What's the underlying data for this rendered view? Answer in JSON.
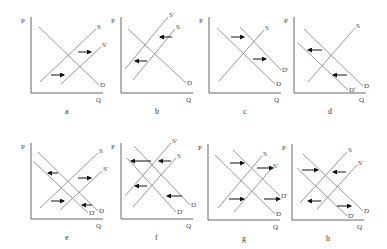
{
  "figure": {
    "axis_labels": {
      "price": "P",
      "quantity": "Q"
    },
    "panels": [
      {
        "id": "a",
        "caption": "a",
        "origin": [
          31,
          93
        ],
        "size": [
          72,
          76
        ],
        "curves": [
          {
            "name": "D",
            "label": "D",
            "from": [
              39,
              27
            ],
            "to": [
              99,
              85
            ]
          },
          {
            "name": "S",
            "label": "S",
            "from": [
              40,
              82
            ],
            "to": [
              96,
              29
            ]
          },
          {
            "name": "S'",
            "label": "S'",
            "from": [
              61,
              84
            ],
            "to": [
              101,
              47
            ]
          }
        ],
        "arrows": [
          {
            "from": [
              51,
              75
            ],
            "to": [
              64,
              75
            ],
            "direction": "right"
          },
          {
            "from": [
              78,
              52
            ],
            "to": [
              91,
              52
            ],
            "direction": "right"
          }
        ]
      },
      {
        "id": "b",
        "caption": "b",
        "origin": [
          121,
          93
        ],
        "size": [
          72,
          76
        ],
        "curves": [
          {
            "name": "D",
            "label": "D",
            "from": [
              128,
              29
            ],
            "to": [
              186,
              83
            ]
          },
          {
            "name": "S'",
            "label": "S'",
            "from": [
              125,
              69
            ],
            "to": [
              168,
              17
            ]
          },
          {
            "name": "S",
            "label": "S",
            "from": [
              133,
              80
            ],
            "to": [
              175,
              29
            ]
          }
        ],
        "arrows": [
          {
            "from": [
              172,
              37
            ],
            "to": [
              160,
              37
            ],
            "direction": "left"
          },
          {
            "from": [
              147,
              61
            ],
            "to": [
              135,
              61
            ],
            "direction": "left"
          }
        ]
      },
      {
        "id": "c",
        "caption": "c",
        "origin": [
          209,
          93
        ],
        "size": [
          72,
          76
        ],
        "curves": [
          {
            "name": "D",
            "label": "D",
            "from": [
              217,
              28
            ],
            "to": [
              275,
              84
            ]
          },
          {
            "name": "D'",
            "label": "D'",
            "from": [
              240,
              27
            ],
            "to": [
              281,
              70
            ]
          },
          {
            "name": "S",
            "label": "S",
            "from": [
              219,
              81
            ],
            "to": [
              264,
              30
            ]
          }
        ],
        "arrows": [
          {
            "from": [
              231,
              37
            ],
            "to": [
              244,
              37
            ],
            "direction": "right"
          },
          {
            "from": [
              253,
              59
            ],
            "to": [
              266,
              59
            ],
            "direction": "right"
          }
        ]
      },
      {
        "id": "d",
        "caption": "d",
        "origin": [
          294,
          93
        ],
        "size": [
          72,
          76
        ],
        "curves": [
          {
            "name": "D",
            "label": "D",
            "from": [
              304,
              29
            ],
            "to": [
              363,
              86
            ]
          },
          {
            "name": "D'",
            "label": "D'",
            "from": [
              298,
              43
            ],
            "to": [
              348,
              90
            ]
          },
          {
            "name": "S",
            "label": "S",
            "from": [
              308,
              82
            ],
            "to": [
              355,
              28
            ]
          }
        ],
        "arrows": [
          {
            "from": [
              322,
              50
            ],
            "to": [
              308,
              50
            ],
            "direction": "left"
          },
          {
            "from": [
              347,
              75
            ],
            "to": [
              333,
              75
            ],
            "direction": "left"
          }
        ]
      },
      {
        "id": "e",
        "caption": "e",
        "origin": [
          31,
          219
        ],
        "size": [
          72,
          76
        ],
        "curves": [
          {
            "name": "D",
            "label": "D",
            "from": [
              38,
              152
            ],
            "to": [
              98,
              211
            ]
          },
          {
            "name": "D'",
            "label": "D'",
            "from": [
              33,
              161
            ],
            "to": [
              88,
              213
            ]
          },
          {
            "name": "S",
            "label": "S",
            "from": [
              40,
              208
            ],
            "to": [
              98,
              153
            ]
          },
          {
            "name": "S'",
            "label": "S'",
            "from": [
              60,
              210
            ],
            "to": [
              102,
              171
            ]
          }
        ],
        "arrows": [
          {
            "from": [
              58,
              173
            ],
            "to": [
              48,
              173
            ],
            "direction": "left"
          },
          {
            "from": [
              78,
              178
            ],
            "to": [
              91,
              178
            ],
            "direction": "right"
          },
          {
            "from": [
              51,
              201
            ],
            "to": [
              64,
              201
            ],
            "direction": "right"
          },
          {
            "from": [
              92,
              205
            ],
            "to": [
              82,
              205
            ],
            "direction": "left"
          }
        ]
      },
      {
        "id": "f",
        "caption": "f",
        "origin": [
          121,
          219
        ],
        "size": [
          72,
          76
        ],
        "curves": [
          {
            "name": "D",
            "label": "D",
            "from": [
              134,
              146
            ],
            "to": [
              190,
              205
            ]
          },
          {
            "name": "D'",
            "label": "D'",
            "from": [
              127,
              158
            ],
            "to": [
              176,
              212
            ]
          },
          {
            "name": "S'",
            "label": "S'",
            "from": [
              125,
              196
            ],
            "to": [
              171,
              143
            ]
          },
          {
            "name": "S",
            "label": "S",
            "from": [
              133,
              207
            ],
            "to": [
              176,
              158
            ]
          }
        ],
        "arrows": [
          {
            "from": [
              151,
              161
            ],
            "to": [
              131,
              161
            ],
            "direction": "left"
          },
          {
            "from": [
              171,
              161
            ],
            "to": [
              159,
              161
            ],
            "direction": "left"
          },
          {
            "from": [
              147,
              186
            ],
            "to": [
              135,
              186
            ],
            "direction": "left"
          },
          {
            "from": [
              182,
              196
            ],
            "to": [
              167,
              196
            ],
            "direction": "left"
          }
        ]
      },
      {
        "id": "g",
        "caption": "g",
        "origin": [
          208,
          220
        ],
        "size": [
          72,
          76
        ],
        "curves": [
          {
            "name": "D",
            "label": "D",
            "from": [
              215,
              155
            ],
            "to": [
              275,
              214
            ]
          },
          {
            "name": "D'",
            "label": "D'",
            "from": [
              233,
              150
            ],
            "to": [
              280,
              196
            ]
          },
          {
            "name": "S",
            "label": "S",
            "from": [
              218,
              208
            ],
            "to": [
              262,
              156
            ]
          },
          {
            "name": "S'",
            "label": "S'",
            "from": [
              234,
              212
            ],
            "to": [
              272,
              168
            ]
          }
        ],
        "arrows": [
          {
            "from": [
              230,
              163
            ],
            "to": [
              244,
              163
            ],
            "direction": "right"
          },
          {
            "from": [
              257,
              168
            ],
            "to": [
              273,
              168
            ],
            "direction": "right"
          },
          {
            "from": [
              229,
              199
            ],
            "to": [
              244,
              199
            ],
            "direction": "right"
          },
          {
            "from": [
              264,
              199
            ],
            "to": [
              280,
              199
            ],
            "direction": "right"
          }
        ]
      },
      {
        "id": "h",
        "caption": "h",
        "origin": [
          292,
          220
        ],
        "size": [
          72,
          76
        ],
        "curves": [
          {
            "name": "D",
            "label": "D",
            "from": [
              303,
              154
            ],
            "to": [
              363,
              211
            ]
          },
          {
            "name": "D'",
            "label": "D'",
            "from": [
              297,
              168
            ],
            "to": [
              347,
              216
            ]
          },
          {
            "name": "S",
            "label": "S",
            "from": [
              300,
              203
            ],
            "to": [
              347,
              152
            ]
          },
          {
            "name": "S'",
            "label": "S'",
            "from": [
              317,
              209
            ],
            "to": [
              357,
              165
            ]
          }
        ],
        "arrows": [
          {
            "from": [
              302,
              170
            ],
            "to": [
              318,
              170
            ],
            "direction": "right"
          },
          {
            "from": [
              346,
              172
            ],
            "to": [
              333,
              172
            ],
            "direction": "left"
          },
          {
            "from": [
              321,
              201
            ],
            "to": [
              308,
              201
            ],
            "direction": "left"
          },
          {
            "from": [
              337,
              206
            ],
            "to": [
              351,
              206
            ],
            "direction": "right"
          }
        ]
      }
    ]
  }
}
